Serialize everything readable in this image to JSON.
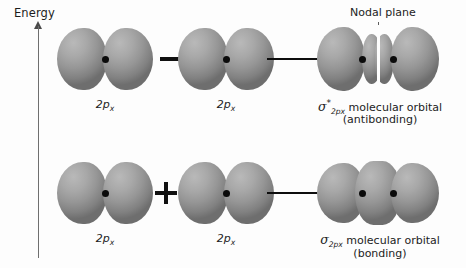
{
  "figure": {
    "axis": {
      "label": "Energy",
      "direction": "up"
    },
    "rows": [
      {
        "id": "antibonding-row",
        "operator": "minus",
        "operator_symbol": "−",
        "arrow": "right-arrow",
        "left_orbital_label_main": "2p",
        "left_orbital_label_sub": "x",
        "right_orbital_label_main": "2p",
        "right_orbital_label_sub": "x",
        "result_sigma": "σ",
        "result_star": "*",
        "result_sub": "2p",
        "result_sub_x": "x",
        "result_text": "molecular orbital",
        "result_note": "(antibonding)",
        "annotation": "Nodal plane"
      },
      {
        "id": "bonding-row",
        "operator": "plus",
        "operator_symbol": "+",
        "arrow": "right-arrow",
        "left_orbital_label_main": "2p",
        "left_orbital_label_sub": "x",
        "right_orbital_label_main": "2p",
        "right_orbital_label_sub": "x",
        "result_sigma": "σ",
        "result_star": "",
        "result_sub": "2p",
        "result_sub_x": "x",
        "result_text": "molecular orbital",
        "result_note": "(bonding)",
        "annotation": ""
      }
    ],
    "colors": {
      "background": "#fdfdfd",
      "lobe_light": "#b9b9b9",
      "lobe_dark": "#6e6e6e",
      "nucleus": "#0b0b0b",
      "ink": "#1c1c1c",
      "axis": "#6f6f6f"
    }
  }
}
